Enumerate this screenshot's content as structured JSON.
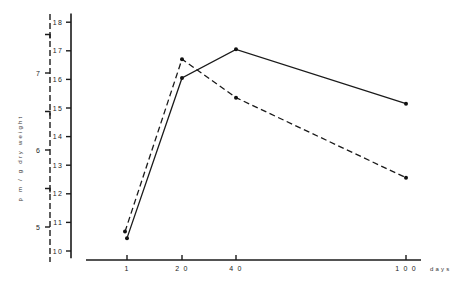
{
  "chart_data": {
    "type": "line",
    "title": "",
    "xlabel": "days",
    "ylabel": "p m / g dry weight",
    "grid": false,
    "legend": "none",
    "x": [
      1,
      20,
      40,
      100
    ],
    "x_tick_labels": [
      "1",
      "2 0",
      "4 0",
      "1 0 0"
    ],
    "y_right_axis": {
      "ticks": [
        10,
        11,
        12,
        13,
        14,
        15,
        16,
        17,
        18
      ],
      "tick_labels": [
        "10",
        "11",
        "12",
        "13",
        "14",
        "15",
        "16",
        "17",
        "18"
      ],
      "range": [
        9.75,
        18.3
      ],
      "style": "solid"
    },
    "y_left_axis": {
      "ticks": [
        5,
        6,
        7
      ],
      "tick_labels": [
        "5",
        "6",
        "7"
      ],
      "minor_ticks": [
        5.5,
        6.5,
        7.5
      ],
      "range": [
        4.6,
        7.7
      ],
      "style": "dashed"
    },
    "series": [
      {
        "name": "solid",
        "style": "solid",
        "axis": "right",
        "values": [
          10.45,
          16.05,
          17.05,
          15.15
        ]
      },
      {
        "name": "dashed",
        "style": "dashed",
        "axis": "left",
        "values": [
          4.94,
          7.18,
          6.68,
          5.64
        ]
      }
    ]
  }
}
